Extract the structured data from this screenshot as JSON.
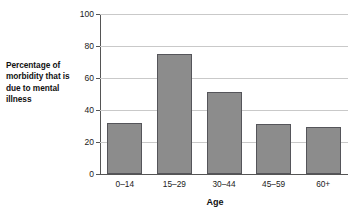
{
  "chart_data": {
    "type": "bar",
    "title": "",
    "categories": [
      "0–14",
      "15–29",
      "30–44",
      "45–59",
      "60+"
    ],
    "values": [
      32,
      75,
      51,
      31,
      29.5
    ],
    "xlabel": "Age",
    "ylabel": "Percentage of morbidity that is due to mental illness",
    "ylim": [
      0,
      100
    ],
    "yticks": [
      0,
      20,
      40,
      60,
      80,
      100
    ],
    "ytick_labels": [
      "0",
      "20",
      "40",
      "60",
      "80",
      "100"
    ],
    "grid": true,
    "legend": false,
    "bar_color": "#8c8c8c",
    "bar_border_color": "#55555a",
    "gridline_color": "#c9c9c9",
    "axis_color": "#555555",
    "background": "#ffffff"
  }
}
